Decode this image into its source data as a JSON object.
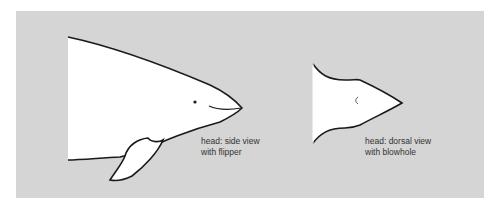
{
  "figure": {
    "background_color": "#d5d5d5",
    "outline_color": "#1a1a1a",
    "fill_color": "#ffffff",
    "panels": [
      {
        "id": "side-view",
        "caption_line1": "head: side view",
        "caption_line2": "with flipper"
      },
      {
        "id": "dorsal-view",
        "caption_line1": "head: dorsal view",
        "caption_line2": "with blowhole"
      }
    ]
  }
}
